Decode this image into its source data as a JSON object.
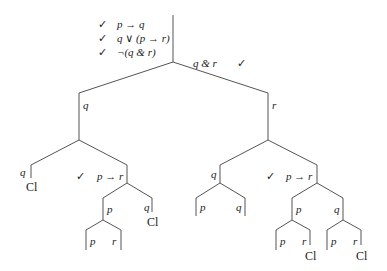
{
  "premises": [
    {
      "check": "✓",
      "formula": "p → q"
    },
    {
      "check": "✓",
      "formula": "q ∨ (p → r)"
    },
    {
      "check": "✓",
      "formula": "¬(q & r)"
    }
  ],
  "conclusion_negation": {
    "formula": "q & r",
    "check": "✓"
  },
  "closed_label": "Cl",
  "nodes": {
    "L_q": "q",
    "R_r": "r",
    "LL_q": "q",
    "LR_imp": "p → r",
    "LR_check": "✓",
    "LRL_p": "p",
    "LRR_q": "q",
    "LRLL_p": "p",
    "LRLR_r": "r",
    "RL_q": "q",
    "RR_imp": "p → r",
    "RR_check": "✓",
    "RLL_p": "p",
    "RLR_q": "q",
    "RRL_p": "p",
    "RRR_q": "q",
    "RRLL_p": "p",
    "RRLR_r": "r",
    "RRRL_p": "p",
    "RRRR_r": "r"
  }
}
